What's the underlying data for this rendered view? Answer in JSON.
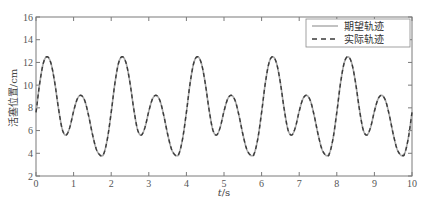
{
  "chart_data": {
    "type": "line",
    "title": "",
    "xlabel": "t/s",
    "xlabel_italic_part": "t",
    "xlabel_unit": "/s",
    "ylabel": "活塞位置/cm",
    "xlim": [
      0,
      10
    ],
    "ylim": [
      2,
      16
    ],
    "xticks": [
      0,
      1,
      2,
      3,
      4,
      5,
      6,
      7,
      8,
      9,
      10
    ],
    "yticks": [
      2,
      4,
      6,
      8,
      10,
      12,
      14,
      16
    ],
    "grid": false,
    "legend_position": "upper right",
    "period": 2,
    "one_period_samples": {
      "t": [
        0,
        0.1,
        0.2,
        0.3,
        0.4,
        0.5,
        0.6,
        0.7,
        0.8,
        0.9,
        1.0,
        1.1,
        1.2,
        1.3,
        1.4,
        1.5,
        1.6,
        1.7,
        1.75,
        1.8,
        1.9,
        2.0
      ],
      "y": [
        7.6,
        10.2,
        12.0,
        12.5,
        11.9,
        10.2,
        7.9,
        6.1,
        5.6,
        6.3,
        7.7,
        8.8,
        9.1,
        8.6,
        7.3,
        5.7,
        4.4,
        3.85,
        3.8,
        3.95,
        5.3,
        7.6
      ]
    },
    "series": [
      {
        "name": "期望轨迹",
        "style": "solid",
        "color": "#a0a0a0"
      },
      {
        "name": "实际轨迹",
        "style": "dashed",
        "color": "#3a3a3a"
      }
    ],
    "key_points": {
      "large_peaks": [
        [
          0.3,
          12.5
        ],
        [
          2.3,
          12.5
        ],
        [
          4.3,
          12.5
        ],
        [
          6.3,
          12.5
        ],
        [
          8.3,
          12.5
        ]
      ],
      "small_peaks": [
        [
          1.2,
          9.1
        ],
        [
          3.2,
          9.1
        ],
        [
          5.2,
          9.1
        ],
        [
          7.2,
          9.1
        ],
        [
          9.2,
          9.1
        ]
      ],
      "shallow_troughs": [
        [
          0.8,
          5.6
        ],
        [
          2.8,
          5.6
        ],
        [
          4.8,
          5.6
        ],
        [
          6.8,
          5.6
        ],
        [
          8.8,
          5.6
        ]
      ],
      "deep_troughs": [
        [
          1.75,
          3.8
        ],
        [
          3.75,
          3.8
        ],
        [
          5.75,
          3.8
        ],
        [
          7.75,
          3.8
        ],
        [
          9.75,
          3.8
        ]
      ]
    }
  },
  "legend": {
    "items": [
      {
        "label": "期望轨迹",
        "style": "solid"
      },
      {
        "label": "实际轨迹",
        "style": "dashed"
      }
    ]
  },
  "axes": {
    "xlabel_italic": "t",
    "xlabel_unit": "/s",
    "ylabel": "活塞位置/cm"
  }
}
